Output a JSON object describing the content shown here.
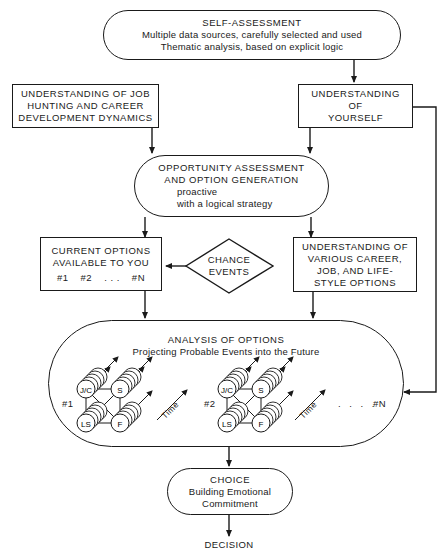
{
  "self_assessment": {
    "title": "SELF-ASSESSMENT",
    "lines": [
      "Multiple data sources, carefully selected and used",
      "Thematic analysis, based on explicit logic"
    ]
  },
  "job_hunting": {
    "lines": [
      "UNDERSTANDING OF JOB",
      "HUNTING AND CAREER",
      "DEVELOPMENT DYNAMICS"
    ]
  },
  "yourself": {
    "lines": [
      "UNDERSTANDING",
      "OF",
      "YOURSELF"
    ]
  },
  "opportunity": {
    "title_lines": [
      "OPPORTUNITY ASSESSMENT",
      "AND OPTION GENERATION"
    ],
    "sub_lines": [
      "proactive",
      "with a logical strategy"
    ]
  },
  "current_options": {
    "lines": [
      "CURRENT OPTIONS",
      "AVAILABLE TO YOU"
    ],
    "options": [
      "#1",
      "#2",
      ". . .",
      "#N"
    ]
  },
  "chance_events": {
    "lines": [
      "CHANCE",
      "EVENTS"
    ]
  },
  "various_options": {
    "lines": [
      "UNDERSTANDING OF",
      "VARIOUS CAREER,",
      "JOB, AND LIFE-",
      "STYLE OPTIONS"
    ]
  },
  "analysis": {
    "title": "ANALYSIS OF OPTIONS",
    "subtitle": "Projecting Probable Events into the Future",
    "option_labels": [
      "#1",
      "#2",
      "#N"
    ],
    "ellipsis": ". . . .",
    "factor_labels": [
      "J/C",
      "S",
      "LS",
      "F"
    ],
    "time_label": "Time"
  },
  "choice": {
    "title": "CHOICE",
    "lines": [
      "Building Emotional",
      "Commitment"
    ]
  },
  "decision": {
    "label": "DECISION"
  },
  "colors": {
    "ink": "#1a1a1a",
    "background": "#ffffff"
  }
}
